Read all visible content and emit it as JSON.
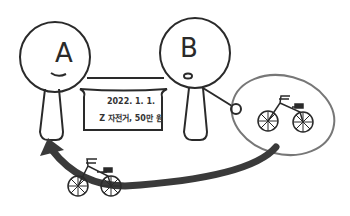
{
  "person_a": {
    "label": "A",
    "expression": "smile"
  },
  "person_b": {
    "label": "B",
    "expression": "open-mouth"
  },
  "contract": {
    "date": "2022. 1. 1.",
    "content": "Z 자전거, 50만 원"
  },
  "object": {
    "name": "bicycle-icon",
    "from": "B",
    "to": "A"
  },
  "colors": {
    "line": "#2a2a2a",
    "ellipse": "#777777",
    "arrow": "#3a3a3a",
    "background": "#ffffff"
  }
}
